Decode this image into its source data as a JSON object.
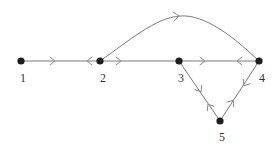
{
  "diagram": {
    "type": "directed-graph",
    "colors": {
      "edge": "#7a7a7a",
      "arrow": "#8a8a8a",
      "node": "#1e1e1e",
      "label": "#333333",
      "background": "#ffffff"
    },
    "nodes": [
      {
        "id": "1",
        "label": "1",
        "x": 21,
        "y": 61,
        "label_x": 23,
        "label_y": 82
      },
      {
        "id": "2",
        "label": "2",
        "x": 100,
        "y": 61,
        "label_x": 103,
        "label_y": 82
      },
      {
        "id": "3",
        "label": "3",
        "x": 179,
        "y": 61,
        "label_x": 181,
        "label_y": 82
      },
      {
        "id": "4",
        "label": "4",
        "x": 259,
        "y": 61,
        "label_x": 262,
        "label_y": 82
      },
      {
        "id": "5",
        "label": "5",
        "x": 220,
        "y": 121,
        "label_x": 222,
        "label_y": 141
      }
    ],
    "edges": [
      {
        "id": "e-1-2",
        "from": "1",
        "to": "2",
        "shape": "straight",
        "arrows": [
          {
            "x": 53,
            "y": 61,
            "direction": "toward-2"
          },
          {
            "x": 89,
            "y": 61,
            "direction": "toward-1"
          }
        ]
      },
      {
        "id": "e-2-3",
        "from": "2",
        "to": "3",
        "shape": "straight",
        "arrows": [
          {
            "x": 119,
            "y": 61,
            "direction": "toward-3"
          }
        ]
      },
      {
        "id": "e-3-4",
        "from": "3",
        "to": "4",
        "shape": "straight",
        "arrows": [
          {
            "x": 203,
            "y": 61,
            "direction": "toward-4"
          },
          {
            "x": 239,
            "y": 61,
            "direction": "toward-3"
          }
        ]
      },
      {
        "id": "e-2-4",
        "from": "2",
        "to": "4",
        "shape": "curved-arc-above",
        "arrows": [
          {
            "x": 177,
            "y": 16,
            "direction": "toward-4"
          }
        ]
      },
      {
        "id": "e-3-5",
        "from": "3",
        "to": "5",
        "shape": "straight",
        "arrows": [
          {
            "x": 200,
            "y": 90,
            "direction": "toward-5"
          },
          {
            "x": 209,
            "y": 106,
            "direction": "toward-3"
          }
        ]
      },
      {
        "id": "e-4-5",
        "from": "4",
        "to": "5",
        "shape": "straight",
        "arrows": [
          {
            "x": 245,
            "y": 84,
            "direction": "toward-5"
          },
          {
            "x": 232,
            "y": 102,
            "direction": "toward-4"
          }
        ]
      }
    ]
  }
}
